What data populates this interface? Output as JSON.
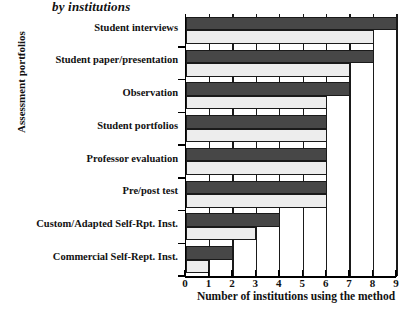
{
  "chart_data": {
    "type": "bar",
    "orientation": "horizontal",
    "title": "by institutions",
    "xlabel": "Number of institutions using the method",
    "ylabel": "Assessment portfolios",
    "categories": [
      "Student interviews",
      "Student paper/presentation",
      "Observation",
      "Student portfolios",
      "Professor evaluation",
      "Pre/post test",
      "Custom/Adapted Self-Rpt. Inst.",
      "Commercial Self-Rept. Inst."
    ],
    "series": [
      {
        "name": "dark",
        "color": "#474747",
        "values": [
          9,
          8,
          7,
          6,
          6,
          6,
          4,
          2
        ]
      },
      {
        "name": "light",
        "color": "#ededed",
        "values": [
          8,
          7,
          6,
          6,
          6,
          6,
          3,
          1
        ]
      }
    ],
    "xticks": [
      0,
      1,
      2,
      3,
      4,
      5,
      6,
      7,
      8,
      9
    ],
    "xlim": [
      0,
      9
    ],
    "grid": true,
    "legend": "none"
  }
}
